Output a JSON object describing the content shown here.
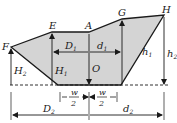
{
  "diagram": {
    "colors": {
      "fill": "#d4d4d4",
      "stroke": "#1a1a1a",
      "background": "#ffffff"
    },
    "points": {
      "F": "F",
      "E": "E",
      "A": "A",
      "G": "G",
      "H": "H",
      "O": "O"
    },
    "dimensions": {
      "D1": "D",
      "D1_sub": "1",
      "d1": "d",
      "d1_sub": "1",
      "H1": "H",
      "H1_sub": "1",
      "H2": "H",
      "H2_sub": "2",
      "h1": "h",
      "h1_sub": "1",
      "h2": "h",
      "h2_sub": "2",
      "D2": "D",
      "D2_sub": "2",
      "d2": "d",
      "d2_sub": "2",
      "w_num": "w",
      "w_den": "2"
    }
  }
}
